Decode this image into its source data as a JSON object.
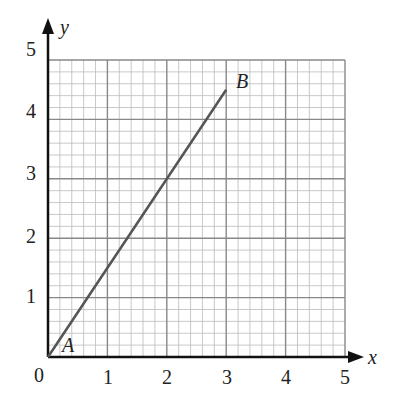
{
  "chart_data": {
    "type": "line",
    "title": "",
    "xlabel": "x",
    "ylabel": "y",
    "xlim": [
      0,
      5
    ],
    "ylim": [
      0,
      5
    ],
    "grid": true,
    "grid_minor_step": 0.2,
    "x_ticks": [
      "0",
      "1",
      "2",
      "3",
      "4",
      "5"
    ],
    "y_ticks": [
      "1",
      "2",
      "3",
      "4",
      "5"
    ],
    "series": [
      {
        "name": "AB",
        "points": [
          {
            "x": 0,
            "y": 0,
            "label": "A"
          },
          {
            "x": 3,
            "y": 4.5,
            "label": "B"
          }
        ]
      }
    ],
    "annotations": [
      {
        "text": "A",
        "x": 0,
        "y": 0
      },
      {
        "text": "B",
        "x": 3,
        "y": 4.5
      }
    ]
  },
  "labels": {
    "origin": "0",
    "x_axis": "x",
    "y_axis": "y",
    "point_a": "A",
    "point_b": "B",
    "x1": "1",
    "x2": "2",
    "x3": "3",
    "x4": "4",
    "x5": "5",
    "y1": "1",
    "y2": "2",
    "y3": "3",
    "y4": "4",
    "y5": "5"
  },
  "colors": {
    "line": "#555555",
    "major_grid": "#888888",
    "minor_grid": "#bbbbbb",
    "axis": "#111111"
  }
}
